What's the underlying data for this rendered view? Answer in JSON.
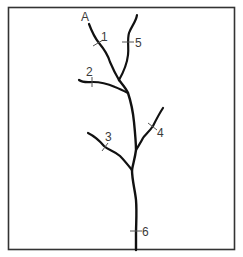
{
  "diagram": {
    "type": "stream-network",
    "source_label": "A",
    "points": [
      {
        "id": "1",
        "label": "1"
      },
      {
        "id": "2",
        "label": "2"
      },
      {
        "id": "3",
        "label": "3"
      },
      {
        "id": "4",
        "label": "4"
      },
      {
        "id": "5",
        "label": "5"
      },
      {
        "id": "6",
        "label": "6"
      }
    ],
    "colors": {
      "line": "#111111",
      "border": "#333333",
      "text": "#3a3a3a",
      "tick": "#555555"
    }
  }
}
